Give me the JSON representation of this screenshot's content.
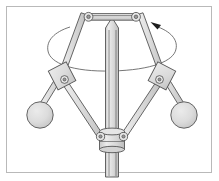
{
  "figure": {
    "caption": "",
    "frame": {
      "border_color": "#b9b9b9",
      "background_color": "#ffffff",
      "x": 6,
      "y": 6,
      "width": 206,
      "height": 167
    }
  },
  "colors": {
    "outline": "#555555",
    "metal_fill": "#dcdcdc",
    "metal_light": "#e4e4e4",
    "pivot_core": "#9a9a9a",
    "orbit_line": "#5d5d5d",
    "arrow": "#1d1d1d",
    "page_background": "#ffffff"
  },
  "components": {
    "spindle": {
      "name": "vertical rotating spindle",
      "tip_x": 112,
      "tip_y": 18,
      "top_y": 26,
      "bottom_y": 176,
      "half_width": 6.5
    },
    "crossbar": {
      "name": "upper cross arm",
      "left_x": 89,
      "right_x": 136,
      "y": 17,
      "thickness": 6
    },
    "top_pivots": [
      {
        "name": "left-top-pivot",
        "cx": 89,
        "cy": 17,
        "r_outer": 4.2,
        "r_inner": 1.7
      },
      {
        "name": "right-top-pivot",
        "cx": 136,
        "cy": 17,
        "r_outer": 4.2,
        "r_inner": 1.7
      }
    ],
    "knee_joints": [
      {
        "name": "left-knee-joint",
        "cx": 62,
        "cy": 78,
        "angle_deg": -26,
        "block_w": 19,
        "block_h": 21,
        "pivot_r_outer": 3.6,
        "pivot_r_inner": 1.5
      },
      {
        "name": "right-knee-joint",
        "cx": 162,
        "cy": 78,
        "angle_deg": 26,
        "block_w": 19,
        "block_h": 21,
        "pivot_r_outer": 3.6,
        "pivot_r_inner": 1.5
      }
    ],
    "upper_arms": [
      {
        "name": "left-upper-arm",
        "x1": 89,
        "y1": 17,
        "x2": 62,
        "y2": 73,
        "width": 5.5
      },
      {
        "name": "right-upper-arm",
        "x1": 136,
        "y1": 17,
        "x2": 162,
        "y2": 73,
        "width": 5.5
      }
    ],
    "ball_arms": [
      {
        "name": "left-ball-arm",
        "x1": 64,
        "y1": 83,
        "x2": 44,
        "y2": 110,
        "width": 5.0
      },
      {
        "name": "right-ball-arm",
        "x1": 160,
        "y1": 83,
        "x2": 180,
        "y2": 110,
        "width": 5.0
      }
    ],
    "link_arms": [
      {
        "name": "left-lower-link",
        "x1": 68,
        "y1": 82,
        "x2": 102,
        "y2": 139,
        "width": 5.0
      },
      {
        "name": "right-lower-link",
        "x1": 156,
        "y1": 82,
        "x2": 122,
        "y2": 139,
        "width": 5.0
      }
    ],
    "flyballs": [
      {
        "name": "left-flyball",
        "cx": 40,
        "cy": 115,
        "r": 13
      },
      {
        "name": "right-flyball",
        "cx": 184,
        "cy": 115,
        "r": 13
      }
    ],
    "sliding_collar": {
      "name": "sliding collar / sleeve",
      "cx": 112,
      "cy": 140,
      "width": 27,
      "height": 20
    },
    "collar_pivots": [
      {
        "name": "left-collar-pivot",
        "cx": 100,
        "cy": 137,
        "r_outer": 4.0,
        "r_inner": 1.6
      },
      {
        "name": "right-collar-pivot",
        "cx": 124,
        "cy": 137,
        "r_outer": 4.0,
        "r_inner": 1.6
      }
    ],
    "rotation_indicator": {
      "name": "rotation direction arrow",
      "ellipse_cx": 112,
      "ellipse_cy": 48,
      "ellipse_rx": 62,
      "ellipse_ry": 20,
      "arrow_x": 158,
      "arrow_y": 24,
      "arrow_angle_deg": -35,
      "direction": "counter-clockwise viewed from above"
    }
  },
  "labels": {
    "list": []
  }
}
